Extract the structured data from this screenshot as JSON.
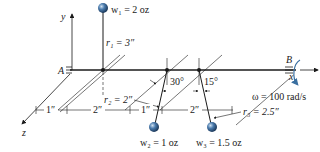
{
  "diagram": {
    "type": "rotating-shaft-with-masses",
    "axes": {
      "x": "x",
      "y": "y",
      "z": "z"
    },
    "supports": {
      "left": "A",
      "right": "B"
    },
    "masses": [
      {
        "id": "w1",
        "label": "w₁ = 2 oz",
        "radius_label": "r₁ = 3″"
      },
      {
        "id": "w2",
        "label": "w₂ = 1 oz",
        "radius_label": "r₂ = 2″",
        "angle": "30°"
      },
      {
        "id": "w3",
        "label": "w₃ = 1.5 oz",
        "radius_label": "r₃ = 2.5″",
        "angle": "15°"
      }
    ],
    "dimensions": [
      "1″",
      "2″",
      "1″",
      "2″"
    ],
    "angular_velocity": "ω = 100 rad/s"
  },
  "colors": {
    "line": "#1a1a1a",
    "mass": "#2f5f8f",
    "omega_arrow": "#3a6fa0"
  }
}
